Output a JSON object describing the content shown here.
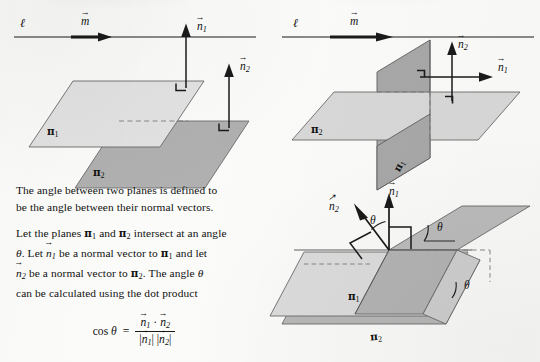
{
  "page": {
    "domain_note": "scanned textbook figure page: angle between two planes",
    "background_color": "#fbfbf9",
    "ink_color": "#1a1a1a",
    "plane_light_color": "#e0e0e0",
    "plane_mid_color": "#c9c9c9",
    "plane_dark_color": "#b0b0b0",
    "width": 540,
    "height": 362
  },
  "diagrams": [
    {
      "id": "parallel-planes",
      "position": "top-left",
      "line_label": "ℓ",
      "vector_label": "m",
      "plane_labels": [
        "π",
        "π"
      ],
      "plane_subscripts": [
        "1",
        "2"
      ],
      "normal_labels": [
        "n",
        "n"
      ],
      "normal_subscripts": [
        "1",
        "2"
      ],
      "right_angle_marks": 2,
      "caption": "two parallel planes with parallel normal vectors"
    },
    {
      "id": "perpendicular-planes",
      "position": "top-right",
      "line_label": "ℓ",
      "vector_label": "m",
      "plane_labels": [
        "π",
        "π"
      ],
      "plane_subscripts": [
        "1",
        "2"
      ],
      "normal_labels": [
        "n",
        "n"
      ],
      "normal_subscripts": [
        "1",
        "2"
      ],
      "right_angle_marks": 2,
      "caption": "two perpendicular planes with perpendicular normal vectors"
    },
    {
      "id": "oblique-planes",
      "position": "bottom-right",
      "plane_labels": [
        "π",
        "π"
      ],
      "plane_subscripts": [
        "1",
        "2"
      ],
      "normal_labels": [
        "n",
        "n"
      ],
      "normal_subscripts": [
        "1",
        "2"
      ],
      "angle_labels": [
        "θ",
        "θ",
        "θ"
      ],
      "right_angle_marks": 2,
      "caption": "two planes meeting at angle theta; normals meet at the same angle"
    }
  ],
  "body_text": {
    "paragraph1_line1": "The angle between two planes is defined to",
    "paragraph1_line2": "be the angle between their normal vectors.",
    "paragraph2_part1": "Let the planes",
    "paragraph2_part2": "and",
    "paragraph2_part3": "intersect at an angle",
    "paragraph2_part4": ". Let",
    "paragraph2_part5": "be a normal vector to",
    "paragraph2_part6": "and let",
    "paragraph2_part7": "be a normal vector  to",
    "paragraph2_part8": ". The angle",
    "paragraph2_part9": "can be  calculated using the dot product",
    "theta": "θ",
    "pi": "π",
    "sub1": "1",
    "sub2": "2",
    "n": "n"
  },
  "formula": {
    "lhs": "cos",
    "lhs_theta": "θ",
    "equals": "=",
    "numerator_n1": "n",
    "numerator_dot": "·",
    "numerator_n2": "n",
    "denominator_bar_open": "|",
    "denominator_n1": "n",
    "denominator_bar_mid": "|  |",
    "denominator_n2": "n",
    "denominator_bar_close": "|",
    "sub1": "1",
    "sub2": "2"
  }
}
